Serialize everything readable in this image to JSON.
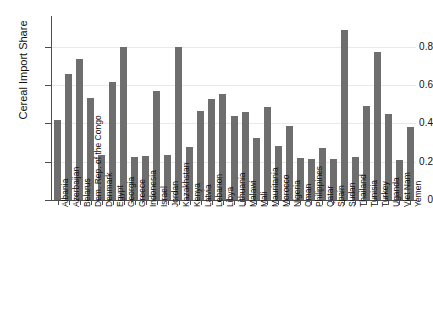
{
  "chart_data": {
    "type": "bar",
    "title": "",
    "xlabel": "",
    "ylabel": "Cereal Import Share",
    "ylim": [
      0,
      0.95
    ],
    "yticks": [
      0,
      0.2,
      0.4,
      0.6,
      0.8
    ],
    "ytick_labels": [
      "0",
      "0.2",
      "0.4",
      "0.6",
      "0.8"
    ],
    "grid": true,
    "legend": false,
    "bar_color": "#6e6e6e",
    "categories": [
      "Albania",
      "Azerbaijan",
      "Belarus",
      "Dem. Rep. of the Congo",
      "Denmark",
      "Egypt",
      "Georgia",
      "Greece",
      "Indonesia",
      "Israel",
      "Jordan",
      "Kazakhstan",
      "Kenya",
      "Latvia",
      "Lebanon",
      "Libya",
      "Lithuania",
      "Malawi",
      "Mali",
      "Mauritania",
      "Morocco",
      "Nigeria",
      "Oman",
      "Philippines",
      "Qatar",
      "Spain",
      "Sudan",
      "Thailand",
      "Tunisia",
      "Turkey",
      "Uganda",
      "Viet Nam",
      "Yemen"
    ],
    "values": [
      0.42,
      0.66,
      0.735,
      0.535,
      0.235,
      0.615,
      0.8,
      0.225,
      0.23,
      0.57,
      0.235,
      0.8,
      0.275,
      0.465,
      0.525,
      0.555,
      0.44,
      0.46,
      0.325,
      0.485,
      0.28,
      0.385,
      0.22,
      0.215,
      0.27,
      0.215,
      0.89,
      0.225,
      0.49,
      0.775,
      0.45,
      0.21,
      0.38
    ]
  }
}
